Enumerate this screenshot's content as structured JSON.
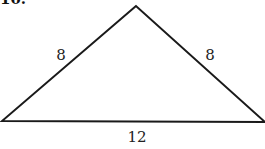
{
  "problem": {
    "number": "10."
  },
  "triangle": {
    "type": "isosceles",
    "vertices": {
      "apex": [
        136,
        6
      ],
      "bottom_left": [
        2,
        121
      ],
      "bottom_right": [
        265,
        122
      ]
    },
    "sides": {
      "left": "8",
      "right": "8",
      "base": "12"
    },
    "stroke_color": "#1a1a1a"
  }
}
